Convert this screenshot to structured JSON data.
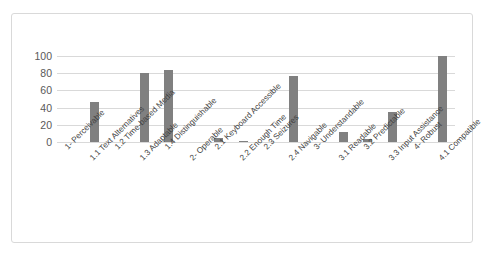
{
  "chart_data": {
    "type": "bar",
    "title": "",
    "xlabel": "",
    "ylabel": "",
    "ylim": [
      0,
      100
    ],
    "yticks": [
      0,
      20,
      40,
      60,
      80,
      100
    ],
    "grid": true,
    "legend": false,
    "bar_color": "#808080",
    "categories": [
      "1- Perceivable",
      "1.1 Text Alternatives",
      "1.2 Time-based Media",
      "1.3 Adaptable",
      "1.4 Distinguishable",
      "2- Operable",
      "2.1 Keyboard Accessible",
      "2.2 Enough Time",
      "2.3 Seizures",
      "2.4 Navigable",
      "3- Understandable",
      "3.1 Readable",
      "3.2 Predictable",
      "3.3 Input Assistance",
      "4- Robust",
      "4.1 Compatible"
    ],
    "values": [
      0,
      47,
      0,
      80,
      84,
      0,
      5,
      1,
      0,
      77,
      0,
      12,
      3,
      35,
      0,
      100
    ]
  }
}
